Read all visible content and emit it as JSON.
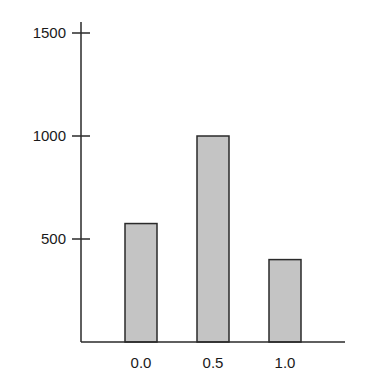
{
  "chart_data": {
    "type": "bar",
    "title": "",
    "xlabel": "",
    "ylabel": "",
    "categories": [
      "0.0",
      "0.5",
      "1.0"
    ],
    "values": [
      575,
      1000,
      400
    ],
    "ylim": [
      0,
      1500
    ],
    "yticks": [
      500,
      1000,
      1500
    ],
    "ytick_labels": [
      "500",
      "1000",
      "1500"
    ],
    "grid": false,
    "legend": null,
    "bar_color": "#c4c4c4",
    "edge_color": "#2a2a2a"
  }
}
